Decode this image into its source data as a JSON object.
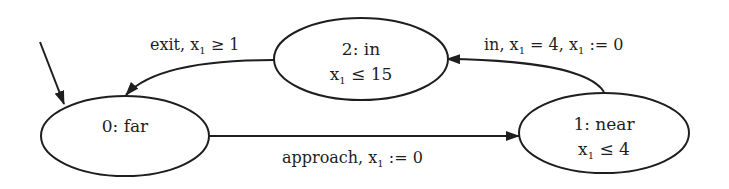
{
  "diagram": {
    "type": "timed-automaton",
    "stroke_color": "#1e1e1e",
    "background": "#ffffff",
    "initial_state": "0",
    "nodes": [
      {
        "id": "0",
        "title": "0: far",
        "invariant_var": "",
        "invariant_sub": "",
        "invariant_rest": ""
      },
      {
        "id": "1",
        "title": "1: near",
        "invariant_var": "x",
        "invariant_sub": "1",
        "invariant_rest": " ≤ 4"
      },
      {
        "id": "2",
        "title": "2: in",
        "invariant_var": "x",
        "invariant_sub": "1",
        "invariant_rest": " ≤ 15"
      }
    ],
    "edges": [
      {
        "from": "0",
        "to": "1",
        "label_pre": "approach, x",
        "label_sub": "1",
        "label_post": " := 0"
      },
      {
        "from": "1",
        "to": "2",
        "label_pre": "in, x",
        "label_sub": "1",
        "label_mid": " = 4, x",
        "label_sub2": "1",
        "label_post": " := 0"
      },
      {
        "from": "2",
        "to": "0",
        "label_pre": "exit, x",
        "label_sub": "1",
        "label_post": " ≥ 1"
      }
    ]
  }
}
